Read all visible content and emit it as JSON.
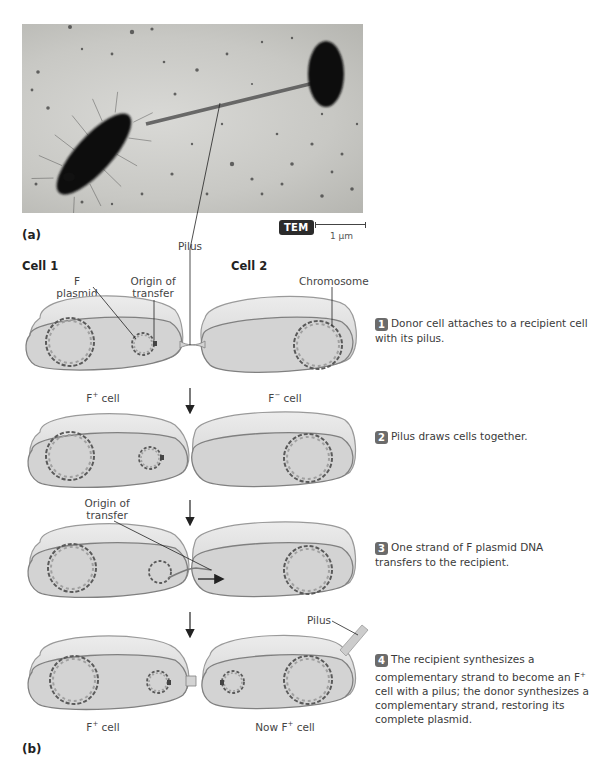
{
  "panel_a": {
    "label": "(a)",
    "micrograph_badge": "TEM",
    "scale_bar": "1 µm",
    "pilus_label": "Pilus"
  },
  "panel_b": {
    "label": "(b)",
    "cell1_heading": "Cell 1",
    "cell2_heading": "Cell 2",
    "labels": {
      "f_plasmid": "F plasmid",
      "origin_of_transfer_line1": "Origin of",
      "origin_of_transfer_line2": "transfer",
      "chromosome": "Chromosome",
      "pilus": "Pilus"
    },
    "cell_labels": {
      "stage1_left_base": "F",
      "stage1_left_sup": "+",
      "stage1_left_suffix": " cell",
      "stage1_right_base": "F",
      "stage1_right_sup": "−",
      "stage1_right_suffix": " cell",
      "stage4_left_base": "F",
      "stage4_left_sup": "+",
      "stage4_left_suffix": " cell",
      "stage4_right_base": "Now F",
      "stage4_right_sup": "+",
      "stage4_right_suffix": " cell"
    },
    "steps": [
      {
        "number": "1",
        "text": "Donor cell attaches to a recipient cell with its pilus."
      },
      {
        "number": "2",
        "text": "Pilus draws cells together."
      },
      {
        "number": "3",
        "text": "One strand of F plasmid DNA transfers to the recipient."
      },
      {
        "number": "4",
        "text_part1": "The recipient synthesizes a complementary strand to become an F",
        "text_sup": "+",
        "text_part2": " cell with a pilus; the donor synthesizes a complementary strand, restoring its complete plasmid."
      }
    ]
  },
  "colors": {
    "cell_fill": "#d4d4d4",
    "cell_top": "#e6e6e6",
    "cell_outline": "#8c8c8c",
    "dna_dark": "#5a5a5a",
    "dna_light": "#a8a8a8",
    "badge_bg": "#6b6b6b",
    "tem_bg": "#2b2b2b"
  }
}
